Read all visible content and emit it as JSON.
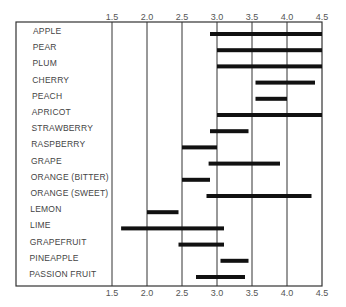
{
  "chart_data": {
    "type": "bar",
    "orientation": "horizontal-range",
    "title": "",
    "xlabel": "",
    "ylabel": "",
    "xlim": [
      1.5,
      4.5
    ],
    "x_ticks": [
      "1.5",
      "2.0",
      "2.5",
      "3.0",
      "3.5",
      "4.0",
      "4.5"
    ],
    "x_tick_values": [
      1.5,
      2.0,
      2.5,
      3.0,
      3.5,
      4.0,
      4.5
    ],
    "grid": "vertical",
    "bar_color": "#111111",
    "categories": [
      "APPLE",
      "PEAR",
      "PLUM",
      "CHERRY",
      "PEACH",
      "APRICOT",
      "STRAWBERRY",
      "RASPBERRY",
      "GRAPE",
      "ORANGE (BITTER)",
      "ORANGE (SWEET)",
      "LEMON",
      "LIME",
      "GRAPEFRUIT",
      "PINEAPPLE",
      "PASSION FRUIT"
    ],
    "ranges": [
      [
        2.9,
        4.5
      ],
      [
        3.0,
        4.5
      ],
      [
        3.0,
        4.5
      ],
      [
        3.55,
        4.4
      ],
      [
        3.55,
        4.0
      ],
      [
        3.0,
        4.5
      ],
      [
        2.9,
        3.45
      ],
      [
        2.5,
        3.0
      ],
      [
        2.88,
        3.9
      ],
      [
        2.5,
        2.9
      ],
      [
        2.85,
        4.35
      ],
      [
        2.0,
        2.45
      ],
      [
        1.63,
        3.1
      ],
      [
        2.45,
        3.1
      ],
      [
        3.05,
        3.45
      ],
      [
        2.7,
        3.4
      ]
    ]
  }
}
